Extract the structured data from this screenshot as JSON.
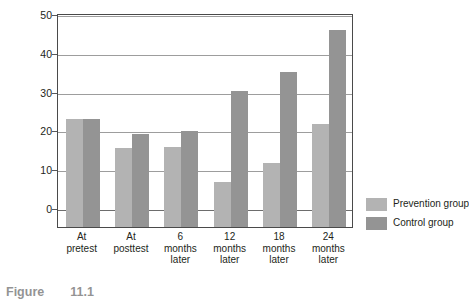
{
  "chart_data": {
    "type": "bar",
    "title": "",
    "xlabel": "",
    "ylabel_line1": "Percentage scoring",
    "ylabel_line2": "moderate to severe levels of depression",
    "categories": [
      "At pretest",
      "At posttest",
      "6 months later",
      "12 months later",
      "18 months later",
      "24 months later"
    ],
    "category_lines": [
      [
        "At",
        "pretest"
      ],
      [
        "At",
        "posttest"
      ],
      [
        "6",
        "months",
        "later"
      ],
      [
        "12",
        "months",
        "later"
      ],
      [
        "18",
        "months",
        "later"
      ],
      [
        "24",
        "months",
        "later"
      ]
    ],
    "series": [
      {
        "name": "Prevention group",
        "color": "#b3b3b3",
        "values": [
          23.2,
          15.8,
          15.9,
          7.0,
          11.9,
          22.0
        ]
      },
      {
        "name": "Control group",
        "color": "#949494",
        "values": [
          23.2,
          19.3,
          20.2,
          30.3,
          35.2,
          46.2
        ]
      }
    ],
    "yticks": [
      0,
      10,
      20,
      30,
      40,
      50
    ],
    "ytick_labels": [
      "0",
      "10",
      "20",
      "30",
      "40",
      "50"
    ],
    "ylim": [
      0,
      50
    ],
    "grid": true,
    "legend_position": "right"
  },
  "legend": {
    "items": [
      {
        "label": "Prevention group",
        "color": "#b3b3b3"
      },
      {
        "label": "Control group",
        "color": "#949494"
      }
    ]
  },
  "caption": {
    "prefix": "Figure",
    "number": "11.1"
  },
  "colors": {
    "prevention": "#b3b3b3",
    "control": "#949494",
    "axis": "#4a4a4a",
    "grid": "#9d9d9d",
    "text": "#231f20"
  }
}
